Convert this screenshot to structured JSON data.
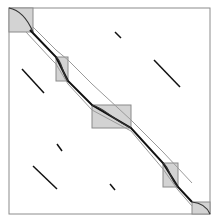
{
  "diagram": {
    "type": "block-diagonal-band-matrix",
    "colors": {
      "frame": "#8c8c8c",
      "block_fill": "#d3d3d3",
      "block_stroke": "#8a8a8a",
      "main_line": "#111111",
      "band_line": "#9a9a9a",
      "offdiag_line": "#111111",
      "curve": "#333333"
    },
    "frame": {
      "x": 9,
      "y": 8,
      "w": 201,
      "h": 206
    },
    "blocks": [
      {
        "x": 9,
        "y": 8,
        "w": 24,
        "h": 24
      },
      {
        "x": 56,
        "y": 57,
        "w": 12,
        "h": 24
      },
      {
        "x": 92,
        "y": 105,
        "w": 39,
        "h": 23
      },
      {
        "x": 163,
        "y": 163,
        "w": 15,
        "h": 24
      },
      {
        "x": 192,
        "y": 202,
        "w": 18,
        "h": 12
      }
    ],
    "offdiag_segments": [
      {
        "x1": 115,
        "y1": 32,
        "x2": 121,
        "y2": 38
      },
      {
        "x1": 154,
        "y1": 60,
        "x2": 180,
        "y2": 87
      },
      {
        "x1": 22,
        "y1": 69,
        "x2": 44,
        "y2": 93
      },
      {
        "x1": 57,
        "y1": 144,
        "x2": 62,
        "y2": 151
      },
      {
        "x1": 33,
        "y1": 166,
        "x2": 57,
        "y2": 189
      },
      {
        "x1": 110,
        "y1": 184,
        "x2": 115,
        "y2": 190
      }
    ]
  }
}
